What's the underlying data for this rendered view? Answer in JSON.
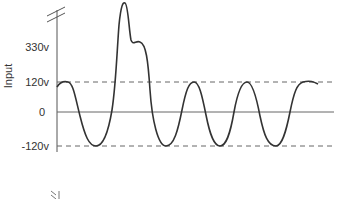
{
  "figure": {
    "y_axis_title": "Input",
    "y_ticks": [
      {
        "label": "330v",
        "value": 330
      },
      {
        "label": "120v",
        "value": 120
      },
      {
        "label": "0",
        "value": 0
      },
      {
        "label": "-120v",
        "value": -120
      }
    ],
    "reference_lines": [
      {
        "value": 120,
        "style": "dashed"
      },
      {
        "value": 0,
        "style": "solid"
      },
      {
        "value": -120,
        "style": "dashed"
      }
    ],
    "axis_break_marks": [
      "top",
      "bottom"
    ],
    "waveform": "sinusoid at ±120v with a transient surge peaking above 330v",
    "colors": {
      "line": "#333333",
      "guide": "#555555"
    }
  }
}
